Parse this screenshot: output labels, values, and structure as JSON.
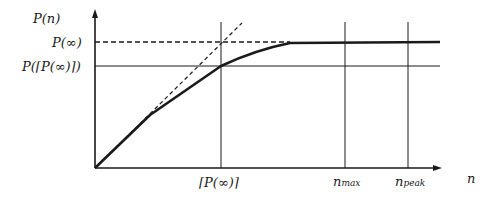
{
  "diagram": {
    "y_axis_label": "P(n)",
    "x_axis_label": "n",
    "y_ticks": [
      {
        "label": "P(∞)",
        "style": "dashed"
      },
      {
        "label": "P(⌈P(∞)⌉)",
        "style": "solid"
      }
    ],
    "x_ticks": [
      {
        "label": "⌈P(∞)⌉"
      },
      {
        "label_main": "n",
        "label_sub": "max"
      },
      {
        "label_main": "n",
        "label_sub": "peak"
      }
    ],
    "curves": [
      {
        "name": "P(n) curve",
        "style": "thick solid",
        "description": "rises nearly linearly from origin, bends at ⌈P(∞)⌉, saturates to P(∞)"
      },
      {
        "name": "tangent",
        "style": "dashed",
        "description": "linear extension from origin crossing P(∞) at ⌈P(∞)⌉"
      }
    ],
    "colors": {
      "ink": "#1a1a1a",
      "background": "#ffffff"
    }
  }
}
